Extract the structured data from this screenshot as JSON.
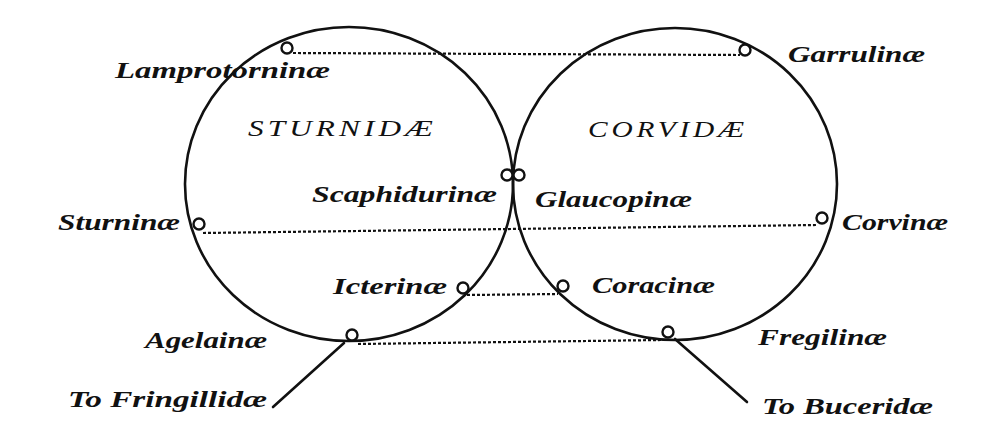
{
  "families": {
    "left": {
      "name": "STURNIDÆ"
    },
    "right": {
      "name": "CORVIDÆ"
    }
  },
  "subfamilies": {
    "lamprotorninae": "Lamprotorninæ",
    "garrulinae": "Garrulinæ",
    "scaphidurinae": "Scaphidurinæ",
    "glaucopinae": "Glaucopinæ",
    "sturninae": "Sturninæ",
    "corvinae": "Corvinæ",
    "icterinae": "Icterinæ",
    "coracinae": "Coracinæ",
    "agelainae": "Agelainæ",
    "fregilinae": "Fregilinæ"
  },
  "outlinks": {
    "left": "To Fringillidæ",
    "right": "To Buceridæ"
  },
  "affinities": [
    {
      "from": "Lamprotorninæ",
      "to": "Garrulinæ",
      "style": "dotted"
    },
    {
      "from": "Sturninæ",
      "to": "Corvinæ",
      "style": "dotted"
    },
    {
      "from": "Icterinæ",
      "to": "Coracinæ",
      "style": "dotted"
    },
    {
      "from": "Agelainæ",
      "to": "Fregilinæ",
      "style": "dotted"
    },
    {
      "from": "Scaphidurinæ",
      "to": "Glaucopinæ",
      "style": "touching"
    },
    {
      "from": "Agelainæ",
      "to": "Fringillidæ",
      "style": "solid"
    },
    {
      "from": "Fregilinæ",
      "to": "Buceridæ",
      "style": "solid"
    }
  ],
  "colors": {
    "ink": "#111111",
    "paper": "#ffffff"
  }
}
